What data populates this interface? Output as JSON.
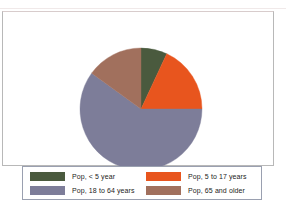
{
  "chart_data": {
    "type": "pie",
    "title": "",
    "categories": [
      "Pop, < 5 year",
      "Pop, 5 to 17 years",
      "Pop, 18 to 64 years",
      "Pop, 65 and older"
    ],
    "values": [
      7,
      18,
      60,
      15
    ],
    "unit": "percent",
    "legend_position": "bottom",
    "grid": false,
    "slices": [
      {
        "label": "Pop, < 5 year",
        "value": 7,
        "color": "#4a5a3e",
        "start_angle": 0,
        "end_angle": 25
      },
      {
        "label": "Pop, 5 to 17 years",
        "value": 18,
        "color": "#e8551e",
        "start_angle": 25,
        "end_angle": 90
      },
      {
        "label": "Pop, 18 to 64 years",
        "value": 60,
        "color": "#7d7d99",
        "start_angle": 90,
        "end_angle": 306
      },
      {
        "label": "Pop, 65 and older",
        "value": 15,
        "color": "#a1705d",
        "start_angle": 306,
        "end_angle": 360
      }
    ]
  },
  "legend": {
    "rows": [
      {
        "left": {
          "label": "Pop, < 5 year",
          "color": "#4a5a3e"
        },
        "right": {
          "label": "Pop, 5 to 17 years",
          "color": "#e8551e"
        }
      },
      {
        "left": {
          "label": "Pop, 18 to 64 years",
          "color": "#7d7d99"
        },
        "right": {
          "label": "Pop, 65 and older",
          "color": "#a1705d"
        }
      }
    ]
  },
  "colors": {
    "under5": "#4a5a3e",
    "age5to17": "#e8551e",
    "age18to64": "#7d7d99",
    "age65plus": "#a1705d",
    "plot_border": "#b8b8b8",
    "legend_border": "#9aa0b0",
    "background": "#ffffff"
  }
}
